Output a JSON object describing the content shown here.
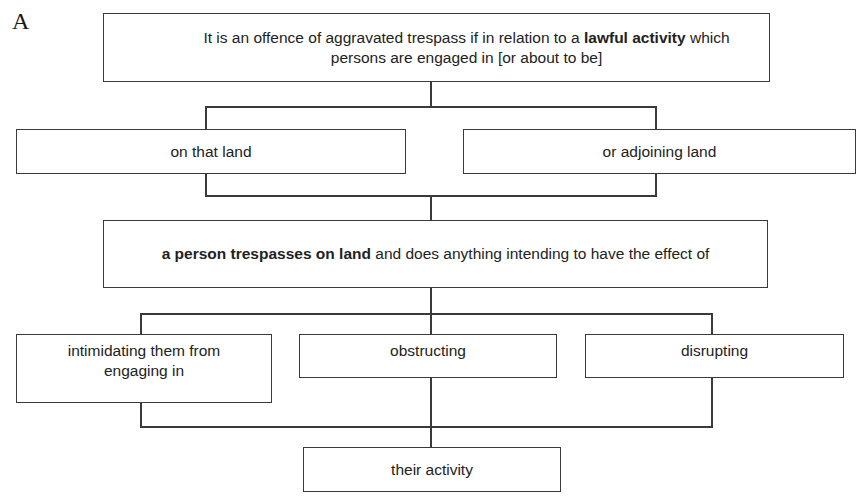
{
  "figure": {
    "label": "A"
  },
  "nodes": {
    "top": {
      "text_before": "It is an offence of aggravated trespass if in relation to a ",
      "text_bold": "lawful activity",
      "text_after": " which persons are engaged in [or about to be]"
    },
    "on_that_land": {
      "text": "on that land"
    },
    "adjoining_land": {
      "text": "or adjoining land"
    },
    "middle": {
      "text_bold": "a person trespasses on land",
      "text_after": " and does anything intending to have the effect of"
    },
    "intimidating": {
      "text": "intimidating them from engaging in"
    },
    "obstructing": {
      "text": "obstructing"
    },
    "disrupting": {
      "text": "disrupting"
    },
    "their_activity": {
      "text": "their activity"
    }
  },
  "colors": {
    "line": "#3a3a3a",
    "text": "#222222",
    "background": "#ffffff"
  }
}
